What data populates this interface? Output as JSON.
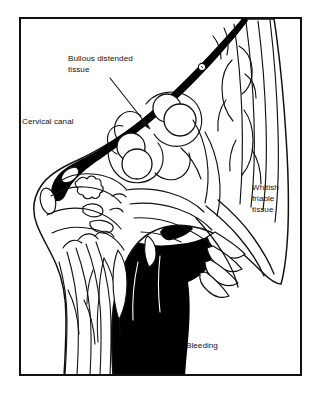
{
  "figure": {
    "kind": "medical-line-illustration",
    "background_color": "#ffffff",
    "ink_color": "#000000",
    "frame": {
      "name": "illustration-border",
      "x": 19,
      "y": 17,
      "width": 283,
      "height": 359,
      "stroke_width": 2,
      "color": "#000000"
    }
  },
  "annotations": [
    {
      "id": "bullous",
      "name": "label-bullous-distended-tissue",
      "lines": [
        "Bullous distended",
        "tissue"
      ],
      "text": "Bullous distended tissue",
      "x": 68,
      "y": 61,
      "has_leader_arrow": true,
      "arrow_from": [
        110,
        78
      ],
      "arrow_to": [
        150,
        129
      ]
    },
    {
      "id": "cervical_canal",
      "name": "label-cervical-canal",
      "lines": [
        "Cervical canal"
      ],
      "text": "Cervical canal",
      "x": 22,
      "y": 124,
      "has_leader_arrow": false
    },
    {
      "id": "whitish",
      "name": "label-whitish-friable-tissue",
      "lines": [
        "Whitish",
        "friable",
        "tissue"
      ],
      "text": "Whitish friable tissue",
      "x": 252,
      "y": 190,
      "has_leader_arrow": false
    },
    {
      "id": "bleeding",
      "name": "label-bleeding",
      "lines": [
        "Bleeding"
      ],
      "text": "Bleeding",
      "x": 186,
      "y": 348,
      "has_leader_arrow": false
    }
  ],
  "anatomy_regions": [
    {
      "name": "cervical-canal-wedge",
      "description": "Thick solid black wedge running diagonally from upper right to lower left",
      "fill": "#000000"
    },
    {
      "name": "bullous-vesicles",
      "description": "Rounded blister-like circular structures in the central tissue mass",
      "fill": "#ffffff",
      "count": 4
    },
    {
      "name": "bleeding-mass",
      "description": "Solid black region at lower centre indicating haemorrhage",
      "fill": "#000000"
    },
    {
      "name": "friable-tissue-striations",
      "description": "Long vertical line striations along right border of specimen",
      "fill": "#ffffff"
    },
    {
      "name": "finger-projections",
      "description": "Frond-like finger projections at lower right margin",
      "fill": "#ffffff"
    }
  ]
}
